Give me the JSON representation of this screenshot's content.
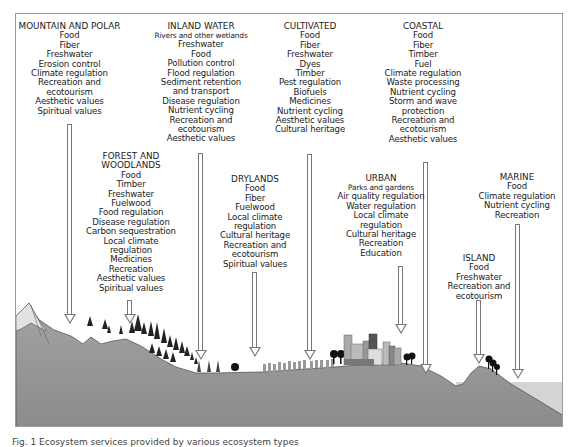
{
  "diagram": {
    "type": "ecosystem-services-landscape",
    "ecosystems": [
      {
        "id": "mountain",
        "title": "MOUNTAIN AND POLAR",
        "subtitle": "",
        "services": [
          "Food",
          "Fiber",
          "Freshwater",
          "Erosion control",
          "Climate regulation",
          "Recreation and",
          "ecotourism",
          "Aesthetic values",
          "Spiritual values"
        ]
      },
      {
        "id": "inland-water",
        "title": "INLAND WATER",
        "subtitle": "Rivers and other wetlands",
        "services": [
          "Freshwater",
          "Food",
          "Pollution control",
          "Flood regulation",
          "Sediment retention",
          "and transport",
          "Disease regulation",
          "Nutrient cycling",
          "Recreation and",
          "ecotourism",
          "Aesthetic values"
        ]
      },
      {
        "id": "cultivated",
        "title": "CULTIVATED",
        "subtitle": "",
        "services": [
          "Food",
          "Fiber",
          "Freshwater",
          "Dyes",
          "Timber",
          "Pest regulation",
          "Biofuels",
          "Medicines",
          "Nutrient cycling",
          "Aesthetic values",
          "Cultural heritage"
        ]
      },
      {
        "id": "coastal",
        "title": "COASTAL",
        "subtitle": "",
        "services": [
          "Food",
          "Fiber",
          "Timber",
          "Fuel",
          "Climate regulation",
          "Waste processing",
          "Nutrient cycling",
          "Storm and wave",
          "protection",
          "Recreation and",
          "ecotourism",
          "Aesthetic values"
        ]
      },
      {
        "id": "forest",
        "title": "FOREST AND",
        "title2": "WOODLANDS",
        "subtitle": "",
        "services": [
          "Food",
          "Timber",
          "Freshwater",
          "Fuelwood",
          "Food regulation",
          "Disease regulation",
          "Carbon sequestration",
          "Local climate",
          "regulation",
          "Medicines",
          "Recreation",
          "Aesthetic values",
          "Spiritual values"
        ]
      },
      {
        "id": "drylands",
        "title": "DRYLANDS",
        "subtitle": "",
        "services": [
          "Food",
          "Fiber",
          "Fuelwood",
          "Local climate",
          "regulation",
          "Cultural heritage",
          "Recreation and",
          "ecotourism",
          "Spiritual values"
        ]
      },
      {
        "id": "urban",
        "title": "URBAN",
        "subtitle": "Parks and gardens",
        "services": [
          "Air quality regulation",
          "Water regulation",
          "Local climate",
          "regulation",
          "Cultural heritage",
          "Recreation",
          "Education"
        ]
      },
      {
        "id": "island",
        "title": "ISLAND",
        "subtitle": "",
        "services": [
          "Food",
          "Freshwater",
          "Recreation and",
          "ecotourism"
        ]
      },
      {
        "id": "marine",
        "title": "MARINE",
        "subtitle": "",
        "services": [
          "Food",
          "Climate regulation",
          "Nutrient cycling",
          "Recreation"
        ]
      }
    ],
    "caption": "Fig. 1 Ecosystem services provided by various ecosystem types"
  }
}
